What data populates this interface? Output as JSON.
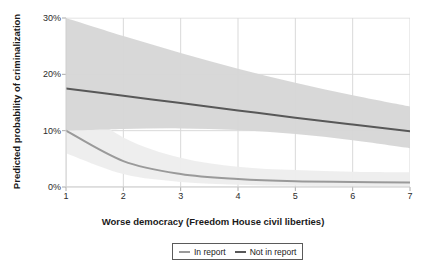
{
  "chart_data": {
    "type": "line",
    "title": "",
    "xlabel": "Worse democracy (Freedom House civil liberties)",
    "ylabel": "Predicted probability of criminalization",
    "xlim": [
      1,
      7
    ],
    "ylim": [
      0,
      30
    ],
    "xticks": [
      1,
      2,
      3,
      4,
      5,
      6,
      7
    ],
    "xtick_labels": [
      "1",
      "2",
      "3",
      "4",
      "5",
      "6",
      "7"
    ],
    "yticks": [
      0,
      10,
      20,
      30
    ],
    "ytick_labels": [
      "0%",
      "10%",
      "20%",
      "30%"
    ],
    "grid": true,
    "legend_position": "bottom",
    "x": [
      1,
      2,
      3,
      4,
      5,
      6,
      7
    ],
    "series": [
      {
        "name": "In report",
        "color": "#9a9a9a",
        "values": [
          10.0,
          4.6,
          2.3,
          1.4,
          1.0,
          0.9,
          0.8
        ],
        "band_lower": [
          6.0,
          2.3,
          0.9,
          0.4,
          0.2,
          0.15,
          0.1
        ],
        "band_upper": [
          16.0,
          8.8,
          5.2,
          3.6,
          3.0,
          2.7,
          2.6
        ],
        "band_color": "#ededed"
      },
      {
        "name": "Not in report",
        "color": "#585858",
        "values": [
          17.5,
          16.2,
          14.9,
          13.6,
          12.3,
          11.1,
          9.9
        ],
        "band_lower": [
          10.0,
          10.3,
          10.4,
          10.1,
          9.4,
          8.3,
          6.9
        ],
        "band_upper": [
          30.0,
          26.8,
          23.8,
          21.0,
          18.5,
          16.3,
          14.3
        ],
        "band_color": "#d6d6d6"
      }
    ]
  },
  "legend": {
    "items": [
      {
        "label": "In report"
      },
      {
        "label": "Not in report"
      }
    ]
  }
}
